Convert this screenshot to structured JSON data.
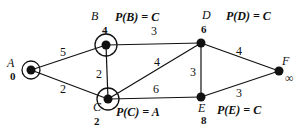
{
  "graph": {
    "nodes": [
      {
        "id": "A",
        "label": "A",
        "dist": "0",
        "x": 31,
        "y": 70,
        "circled": true
      },
      {
        "id": "B",
        "label": "B",
        "dist": "4",
        "x": 106,
        "y": 45,
        "circled": true
      },
      {
        "id": "C",
        "label": "C",
        "dist": "2",
        "x": 108,
        "y": 99,
        "circled": true
      },
      {
        "id": "D",
        "label": "D",
        "dist": "6",
        "x": 201,
        "y": 43,
        "circled": false
      },
      {
        "id": "E",
        "label": "E",
        "dist": "8",
        "x": 201,
        "y": 97,
        "circled": false
      },
      {
        "id": "F",
        "label": "F",
        "dist": "∞",
        "x": 279,
        "y": 71,
        "circled": false
      }
    ],
    "edges": [
      {
        "from": "A",
        "to": "B",
        "weight": "5"
      },
      {
        "from": "A",
        "to": "C",
        "weight": "2"
      },
      {
        "from": "B",
        "to": "C",
        "weight": "2"
      },
      {
        "from": "B",
        "to": "D",
        "weight": "3"
      },
      {
        "from": "C",
        "to": "D",
        "weight": "4"
      },
      {
        "from": "C",
        "to": "E",
        "weight": "6"
      },
      {
        "from": "D",
        "to": "E",
        "weight": "3"
      },
      {
        "from": "D",
        "to": "F",
        "weight": "4"
      },
      {
        "from": "E",
        "to": "F",
        "weight": "3"
      }
    ],
    "predecessors": {
      "B": "P(B) = C",
      "C": "P(C) = A",
      "D": "P(D) = C",
      "E": "P(E) = C"
    }
  }
}
